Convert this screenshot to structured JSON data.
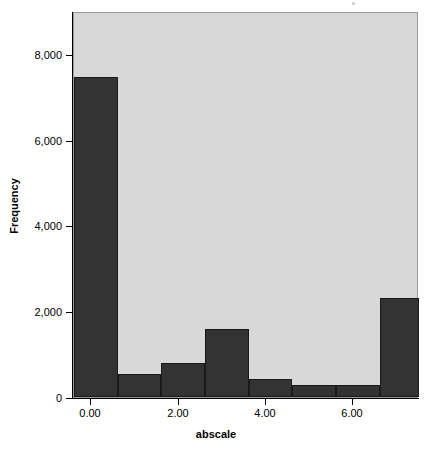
{
  "chart_data": {
    "type": "bar",
    "title": "",
    "subtitle": "",
    "xlabel": "abscale",
    "ylabel": "Frequency",
    "grid": false,
    "legend": "none",
    "xlim": [
      -0.4,
      7.5
    ],
    "ylim": [
      0,
      9000
    ],
    "x_tick_labels": [
      "0.00",
      "2.00",
      "4.00",
      "6.00"
    ],
    "x_tick_values": [
      0.0,
      2.0,
      4.0,
      6.0
    ],
    "y_tick_labels": [
      "0",
      "2,000",
      "4,000",
      "6,000",
      "8,000"
    ],
    "y_tick_values": [
      0,
      2000,
      4000,
      6000,
      8000
    ],
    "bin_width": 1.0,
    "bin_starts": [
      -0.4,
      0.6,
      1.6,
      2.6,
      3.6,
      4.6,
      5.6,
      6.6
    ],
    "categories": [
      "-0.4 to 0.6",
      "0.6 to 1.6",
      "1.6 to 2.6",
      "2.6 to 3.6",
      "3.6 to 4.6",
      "4.6 to 5.6",
      "5.6 to 6.6",
      "6.6 to 7.5"
    ],
    "values": [
      7450,
      540,
      790,
      1590,
      430,
      280,
      280,
      2300
    ],
    "bar_color": "#333333",
    "panel_color": "#d8d8d8"
  },
  "axes": {
    "y_title": "Frequency",
    "x_title": "abscale"
  }
}
